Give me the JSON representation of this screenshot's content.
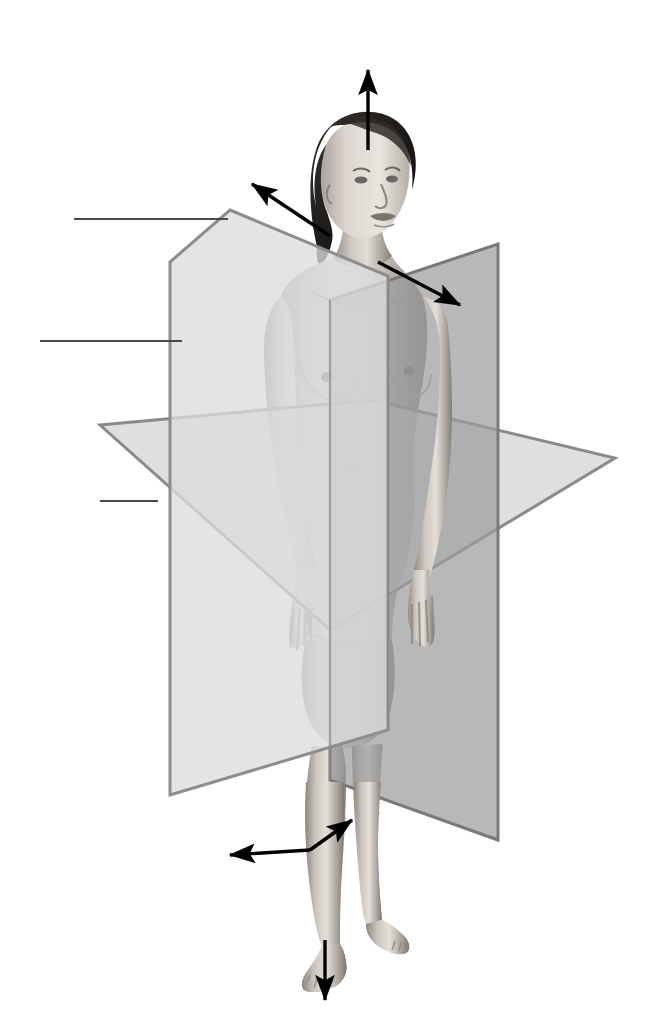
{
  "figure": {
    "background_color": "#ffffff",
    "width": 662,
    "height": 1031
  },
  "palette": {
    "sagittal_plane_fill": "#dcdcdc",
    "sagittal_plane_stroke": "#8d8d8d",
    "coronal_plane_fill": "#9d9d9d",
    "coronal_plane_stroke": "#7a7a7a",
    "transverse_plane_fill": "#d2d2d2",
    "transverse_plane_stroke": "#8a8a8a",
    "arrow_color": "#000000",
    "leader_line_color": "#4a4a4a",
    "skin_light": "#e8e2dc",
    "skin_mid": "#b9b2ab",
    "skin_shadow": "#8d8781",
    "hair_dark": "#1c1a19"
  },
  "planes": [
    {
      "id": "sagittal",
      "name": "Sagittal (median) plane",
      "orientation": "vertical, divides body into left and right",
      "fill": "#dcdcdc",
      "opacity": 0.78,
      "points": "230,210 388,276 388,730 170,795 170,262"
    },
    {
      "id": "coronal",
      "name": "Coronal (frontal) plane",
      "orientation": "vertical, divides body into front and back",
      "fill": "#9d9d9d",
      "opacity": 0.72,
      "points": "498,244 498,840 330,780 330,300"
    },
    {
      "id": "transverse",
      "name": "Transverse (horizontal) plane",
      "orientation": "horizontal, divides body into upper and lower",
      "fill": "#d2d2d2",
      "opacity": 0.7,
      "points": "100,425 372,400 615,458 330,630"
    }
  ],
  "axis_arrows": [
    {
      "id": "superior-arrow",
      "name": "superior (upward) direction arrow",
      "from": [
        368,
        150
      ],
      "to": [
        368,
        70
      ],
      "direction": "superior"
    },
    {
      "id": "posterior-arrow",
      "name": "posterior (back, upper-left) direction arrow",
      "from": [
        330,
        236
      ],
      "to": [
        252,
        184
      ],
      "direction": "posterior"
    },
    {
      "id": "anterior-right-arrow",
      "name": "anterior / lateral right (lower-right) direction arrow",
      "from": [
        378,
        262
      ],
      "to": [
        460,
        305
      ],
      "direction": "anterior-lateral"
    },
    {
      "id": "lateral-right-arrow",
      "name": "lateral right (upper-right) direction arrow",
      "from": [
        310,
        850
      ],
      "to": [
        352,
        820
      ],
      "direction": "lateral-right"
    },
    {
      "id": "lateral-left-arrow",
      "name": "lateral left (lower-left) direction arrow",
      "from": [
        310,
        850
      ],
      "to": [
        230,
        855
      ],
      "direction": "lateral-left"
    },
    {
      "id": "inferior-arrow",
      "name": "inferior (downward) direction arrow",
      "from": [
        325,
        940
      ],
      "to": [
        325,
        1000
      ],
      "direction": "inferior"
    }
  ],
  "callouts": [
    {
      "id": "callout-sagittal",
      "name": "leader line to sagittal plane",
      "label": "",
      "line": [
        74,
        219,
        228,
        219
      ],
      "target_plane": "sagittal"
    },
    {
      "id": "callout-coronal",
      "name": "leader line to coronal plane",
      "label": "",
      "line": [
        40,
        341,
        182,
        341
      ],
      "target_plane": "coronal"
    },
    {
      "id": "callout-transverse",
      "name": "leader line to transverse plane",
      "label": "",
      "line": [
        100,
        501,
        158,
        501
      ],
      "target_plane": "transverse"
    }
  ],
  "figure_parts": {
    "head": "head turned slightly to the subject's left",
    "hair": "dark hair pulled back",
    "arms": "arms at sides, palms facing forward",
    "legs": "standing, feet slightly apart",
    "pose": "anatomical position"
  }
}
